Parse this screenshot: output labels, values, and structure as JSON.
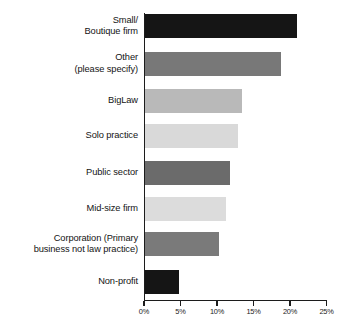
{
  "chart_data": {
    "type": "bar",
    "orientation": "horizontal",
    "title": "",
    "subtitle": "",
    "xlabel": "",
    "ylabel": "",
    "xlim": [
      0,
      25
    ],
    "grid": false,
    "legend": false,
    "x_tick_labels": [
      "0%",
      "5%",
      "10%",
      "15%",
      "20%",
      "25%"
    ],
    "x_tick_values": [
      0,
      5,
      10,
      15,
      20,
      25
    ],
    "categories": [
      "Small/\nBoutique firm",
      "Other\n(please specify)",
      "BigLaw",
      "Solo practice",
      "Public sector",
      "Mid-size firm",
      "Corporation (Primary\nbusiness not law practice)",
      "Non-profit"
    ],
    "values": [
      20.8,
      18.6,
      13.3,
      12.7,
      11.6,
      11.1,
      10.2,
      4.7
    ],
    "bar_colors": [
      "#151515",
      "#787878",
      "#b9b9b9",
      "#d9d9d9",
      "#6b6b6b",
      "#dcdcdc",
      "#7a7a7a",
      "#151515"
    ],
    "axis_color": "#1c1c1c",
    "background_color": "#ffffff"
  },
  "axis": {
    "ticks": [
      {
        "label": "0%",
        "value": 0
      },
      {
        "label": "5%",
        "value": 5
      },
      {
        "label": "10%",
        "value": 10
      },
      {
        "label": "15%",
        "value": 15
      },
      {
        "label": "20%",
        "value": 20
      },
      {
        "label": "25%",
        "value": 25
      }
    ]
  },
  "rows": [
    {
      "label": "Small/\nBoutique firm",
      "value": 20.8,
      "color": "#151515"
    },
    {
      "label": "Other\n(please specify)",
      "value": 18.6,
      "color": "#787878"
    },
    {
      "label": "BigLaw",
      "value": 13.3,
      "color": "#b9b9b9"
    },
    {
      "label": "Solo practice",
      "value": 12.7,
      "color": "#d9d9d9"
    },
    {
      "label": "Public sector",
      "value": 11.6,
      "color": "#6b6b6b"
    },
    {
      "label": "Mid-size firm",
      "value": 11.1,
      "color": "#dcdcdc"
    },
    {
      "label": "Corporation (Primary\nbusiness not law practice)",
      "value": 10.2,
      "color": "#7a7a7a"
    },
    {
      "label": "Non-profit",
      "value": 4.7,
      "color": "#151515"
    }
  ]
}
